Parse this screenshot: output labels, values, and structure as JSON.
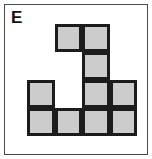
{
  "panel": {
    "label": "E",
    "frame_color": "#4a4a4a",
    "background_color": "#ffffff"
  },
  "shape": {
    "name": "polyomino-tile-E",
    "grid_columns": 4,
    "grid_rows": 4,
    "cell_size_px": 27.5,
    "fill_color": "#cccccc",
    "stroke_color": "#1c1c1c",
    "filled_count": 10,
    "rows": [
      {
        "row": 0,
        "cells": [
          0,
          1,
          1,
          0
        ]
      },
      {
        "row": 1,
        "cells": [
          0,
          0,
          1,
          0
        ]
      },
      {
        "row": 2,
        "cells": [
          1,
          0,
          1,
          1
        ]
      },
      {
        "row": 3,
        "cells": [
          1,
          1,
          1,
          1
        ]
      }
    ]
  }
}
